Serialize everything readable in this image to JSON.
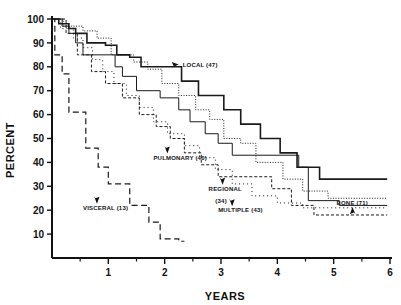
{
  "chart_data": {
    "type": "line",
    "subtype": "kaplan-meier-step",
    "title": "",
    "xlabel": "YEARS",
    "ylabel": "PERCENT",
    "xlim": [
      0,
      6
    ],
    "ylim": [
      0,
      100
    ],
    "grid": false,
    "legend_position": "inline-annotations",
    "x_ticks": [
      "1",
      "2",
      "3",
      "4",
      "5",
      "6"
    ],
    "x_tick_values": [
      1,
      2,
      3,
      4,
      5,
      6
    ],
    "x_minor_ticks": [
      0.5,
      1.5,
      2.5,
      3.5,
      4.5,
      5.5
    ],
    "y_ticks": [
      "10",
      "20",
      "30",
      "40",
      "50",
      "60",
      "70",
      "80",
      "90",
      "100"
    ],
    "y_tick_values": [
      10,
      20,
      30,
      40,
      50,
      60,
      70,
      80,
      90,
      100
    ],
    "series": [
      {
        "name": "LOCAL",
        "n": 47,
        "label": "LOCAL  (47)",
        "line_style": "solid",
        "stroke_width": 1.6,
        "dash": "none",
        "points": [
          [
            0.0,
            100
          ],
          [
            0.12,
            100
          ],
          [
            0.12,
            98
          ],
          [
            0.3,
            98
          ],
          [
            0.3,
            96
          ],
          [
            0.42,
            96
          ],
          [
            0.42,
            94
          ],
          [
            0.62,
            94
          ],
          [
            0.62,
            90
          ],
          [
            0.95,
            90
          ],
          [
            0.95,
            89
          ],
          [
            1.15,
            89
          ],
          [
            1.15,
            85
          ],
          [
            1.38,
            85
          ],
          [
            1.38,
            84
          ],
          [
            1.58,
            84
          ],
          [
            1.58,
            80
          ],
          [
            2.3,
            80
          ],
          [
            2.3,
            74
          ],
          [
            2.6,
            74
          ],
          [
            2.6,
            68
          ],
          [
            3.05,
            68
          ],
          [
            3.05,
            62
          ],
          [
            3.35,
            62
          ],
          [
            3.35,
            56
          ],
          [
            3.7,
            56
          ],
          [
            3.7,
            50
          ],
          [
            4.05,
            50
          ],
          [
            4.05,
            44
          ],
          [
            4.35,
            44
          ],
          [
            4.35,
            38
          ],
          [
            4.75,
            38
          ],
          [
            4.75,
            33
          ],
          [
            5.95,
            33
          ]
        ]
      },
      {
        "name": "PULMONARY",
        "n": 40,
        "label": "PULMONARY  (40)",
        "line_style": "solid-thin",
        "stroke_width": 1.0,
        "dash": "none",
        "points": [
          [
            0.0,
            100
          ],
          [
            0.18,
            100
          ],
          [
            0.18,
            97
          ],
          [
            0.3,
            97
          ],
          [
            0.3,
            94
          ],
          [
            0.42,
            94
          ],
          [
            0.42,
            90
          ],
          [
            0.55,
            90
          ],
          [
            0.55,
            85
          ],
          [
            1.12,
            85
          ],
          [
            1.12,
            80
          ],
          [
            1.25,
            80
          ],
          [
            1.25,
            76
          ],
          [
            1.5,
            76
          ],
          [
            1.5,
            70
          ],
          [
            1.92,
            70
          ],
          [
            1.92,
            67
          ],
          [
            2.25,
            67
          ],
          [
            2.25,
            62
          ],
          [
            2.45,
            62
          ],
          [
            2.45,
            57
          ],
          [
            2.72,
            57
          ],
          [
            2.72,
            52
          ],
          [
            2.95,
            52
          ],
          [
            2.95,
            48
          ],
          [
            3.2,
            48
          ],
          [
            3.2,
            43
          ],
          [
            4.38,
            43
          ],
          [
            4.38,
            38
          ],
          [
            4.55,
            38
          ],
          [
            4.55,
            24
          ],
          [
            5.1,
            24
          ],
          [
            5.1,
            22
          ],
          [
            5.95,
            22
          ]
        ]
      },
      {
        "name": "REGIONAL",
        "n": 34,
        "label": "REGIONAL",
        "label_line2": "(34)",
        "line_style": "dotted",
        "stroke_width": 1.0,
        "dash": "1,1.6",
        "points": [
          [
            0.0,
            100
          ],
          [
            0.2,
            100
          ],
          [
            0.2,
            97
          ],
          [
            0.55,
            97
          ],
          [
            0.55,
            95
          ],
          [
            0.8,
            95
          ],
          [
            0.8,
            92
          ],
          [
            1.05,
            92
          ],
          [
            1.05,
            85
          ],
          [
            1.45,
            85
          ],
          [
            1.45,
            82
          ],
          [
            1.7,
            82
          ],
          [
            1.7,
            79
          ],
          [
            1.95,
            79
          ],
          [
            1.95,
            73
          ],
          [
            2.25,
            73
          ],
          [
            2.25,
            68
          ],
          [
            2.55,
            68
          ],
          [
            2.55,
            62
          ],
          [
            2.8,
            62
          ],
          [
            2.8,
            58
          ],
          [
            3.05,
            58
          ],
          [
            3.05,
            50
          ],
          [
            3.35,
            50
          ],
          [
            3.35,
            48
          ],
          [
            3.62,
            48
          ],
          [
            3.62,
            40
          ],
          [
            4.1,
            40
          ],
          [
            4.1,
            33
          ],
          [
            4.45,
            33
          ],
          [
            4.45,
            28
          ],
          [
            4.9,
            28
          ],
          [
            4.9,
            25
          ],
          [
            5.95,
            25
          ]
        ]
      },
      {
        "name": "MULTIPLE",
        "n": 43,
        "label": "MULTIPLE  (43)",
        "line_style": "dashed-short",
        "stroke_width": 1.0,
        "dash": "3,2",
        "points": [
          [
            0.0,
            100
          ],
          [
            0.25,
            100
          ],
          [
            0.25,
            94
          ],
          [
            0.45,
            94
          ],
          [
            0.45,
            85
          ],
          [
            0.7,
            85
          ],
          [
            0.7,
            78
          ],
          [
            0.95,
            78
          ],
          [
            0.95,
            73
          ],
          [
            1.25,
            73
          ],
          [
            1.25,
            67
          ],
          [
            1.55,
            67
          ],
          [
            1.55,
            60
          ],
          [
            1.85,
            60
          ],
          [
            1.85,
            55
          ],
          [
            2.1,
            55
          ],
          [
            2.1,
            50
          ],
          [
            2.35,
            50
          ],
          [
            2.35,
            44
          ],
          [
            2.65,
            44
          ],
          [
            2.65,
            39
          ],
          [
            2.95,
            39
          ],
          [
            2.95,
            34
          ],
          [
            3.9,
            34
          ],
          [
            3.9,
            29
          ],
          [
            4.25,
            29
          ],
          [
            4.25,
            22
          ],
          [
            4.65,
            22
          ],
          [
            4.65,
            18
          ],
          [
            5.95,
            18
          ]
        ]
      },
      {
        "name": "BONE",
        "n": 71,
        "label": "BONE  (71)",
        "line_style": "dotted-sparse",
        "stroke_width": 1.0,
        "dash": "1,3",
        "points": [
          [
            0.0,
            100
          ],
          [
            0.15,
            100
          ],
          [
            0.15,
            96
          ],
          [
            0.38,
            96
          ],
          [
            0.38,
            92
          ],
          [
            0.55,
            92
          ],
          [
            0.55,
            88
          ],
          [
            0.72,
            88
          ],
          [
            0.72,
            83
          ],
          [
            0.9,
            83
          ],
          [
            0.9,
            78
          ],
          [
            1.1,
            78
          ],
          [
            1.1,
            73
          ],
          [
            1.32,
            73
          ],
          [
            1.32,
            68
          ],
          [
            1.55,
            68
          ],
          [
            1.55,
            63
          ],
          [
            1.8,
            63
          ],
          [
            1.8,
            57
          ],
          [
            2.05,
            57
          ],
          [
            2.05,
            52
          ],
          [
            2.35,
            52
          ],
          [
            2.35,
            47
          ],
          [
            2.62,
            47
          ],
          [
            2.62,
            42
          ],
          [
            2.9,
            42
          ],
          [
            2.9,
            37
          ],
          [
            3.2,
            37
          ],
          [
            3.2,
            31
          ],
          [
            3.55,
            31
          ],
          [
            3.55,
            26
          ],
          [
            4.0,
            26
          ],
          [
            4.0,
            23
          ],
          [
            4.45,
            23
          ],
          [
            4.45,
            21
          ],
          [
            5.95,
            21
          ]
        ]
      },
      {
        "name": "VISCERAL",
        "n": 13,
        "label": "VISCERAL  (13)",
        "line_style": "dashed-long",
        "stroke_width": 1.2,
        "dash": "6,3.5",
        "points": [
          [
            0.0,
            100
          ],
          [
            0.05,
            100
          ],
          [
            0.05,
            85
          ],
          [
            0.18,
            85
          ],
          [
            0.18,
            77
          ],
          [
            0.3,
            77
          ],
          [
            0.3,
            61
          ],
          [
            0.6,
            61
          ],
          [
            0.6,
            46
          ],
          [
            0.82,
            46
          ],
          [
            0.82,
            38
          ],
          [
            1.0,
            38
          ],
          [
            1.0,
            31
          ],
          [
            1.38,
            31
          ],
          [
            1.38,
            22
          ],
          [
            1.72,
            22
          ],
          [
            1.72,
            15
          ],
          [
            1.92,
            15
          ],
          [
            1.92,
            8
          ],
          [
            2.25,
            8
          ],
          [
            2.25,
            7
          ],
          [
            2.35,
            7
          ]
        ]
      }
    ],
    "annotations": [
      {
        "text": "LOCAL  (47)",
        "x": 2.32,
        "y": 81,
        "arrow": "left-down"
      },
      {
        "text": "PULMONARY  (40)",
        "x": 1.8,
        "y": 42,
        "arrow": "up-right"
      },
      {
        "text": "REGIONAL",
        "x": 2.78,
        "y": 29,
        "arrow": "up-right"
      },
      {
        "text": "(34)",
        "x": 2.9,
        "y": 24,
        "arrow": "none"
      },
      {
        "text": "MULTIPLE  (43)",
        "x": 2.95,
        "y": 20,
        "arrow": "up-right"
      },
      {
        "text": "BONE  (71)",
        "x": 5.05,
        "y": 23,
        "arrow": "down-left"
      },
      {
        "text": "VISCERAL  (13)",
        "x": 0.55,
        "y": 21,
        "arrow": "up-right"
      }
    ]
  },
  "axis": {
    "ylabel": "PERCENT",
    "xlabel": "YEARS"
  }
}
